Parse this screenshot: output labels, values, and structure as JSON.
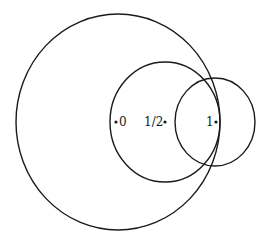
{
  "diagram": {
    "background": "#ffffff",
    "stroke": "#1a1a1a",
    "circles": [
      {
        "name": "large-circle",
        "cx": 118,
        "cy": 122,
        "rx": 102,
        "ry": 108
      },
      {
        "name": "medium-circle",
        "cx": 165,
        "cy": 122,
        "rx": 55,
        "ry": 60
      },
      {
        "name": "small-circle",
        "cx": 215,
        "cy": 122,
        "rx": 40,
        "ry": 44
      }
    ],
    "points": [
      {
        "name": "point-0",
        "label": "0",
        "x": 116,
        "y": 122
      },
      {
        "name": "point-half",
        "label": "1/2",
        "x": 165,
        "y": 122
      },
      {
        "name": "point-1",
        "label": "1",
        "x": 216,
        "y": 122
      }
    ]
  }
}
